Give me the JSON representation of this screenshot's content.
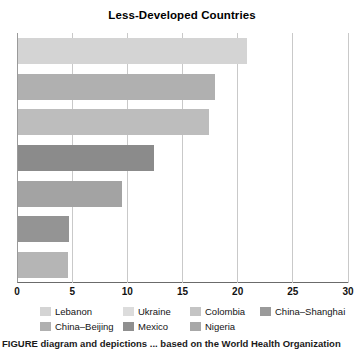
{
  "chart_data": {
    "type": "bar",
    "orientation": "horizontal",
    "title": "Less-Developed Countries",
    "xlabel": "",
    "ylabel": "",
    "xlim": [
      0,
      30
    ],
    "xticks": [
      0,
      5,
      10,
      15,
      20,
      25,
      30
    ],
    "xtick_labels": [
      "0",
      "5",
      "10",
      "15",
      "20",
      "25",
      "30"
    ],
    "grid": true,
    "grid_axis": "x",
    "legend_position": "bottom",
    "categories": [
      "Lebanon",
      "Ukraine",
      "Colombia",
      "China–Shanghai",
      "China–Beijing",
      "Mexico",
      "Nigeria"
    ],
    "values": [
      20.8,
      17.9,
      17.3,
      12.3,
      9.4,
      4.6,
      4.5
    ],
    "colors": [
      "#d4d4d4",
      "#b0b0b0",
      "#bdbdbd",
      "#8b8b8b",
      "#a3a3a3",
      "#949494",
      "#b5b5b5"
    ]
  },
  "legend": {
    "rows": [
      [
        {
          "label": "Lebanon",
          "color": "#d4d4d4"
        },
        {
          "label": "Ukraine",
          "color": "#dcdcdc"
        },
        {
          "label": "Colombia",
          "color": "#c4c4c4"
        },
        {
          "label": "China–Shanghai",
          "color": "#9a9a9a"
        }
      ],
      [
        {
          "label": "China–Beijing",
          "color": "#b0b0b0"
        },
        {
          "label": "Mexico",
          "color": "#8f8f8f"
        },
        {
          "label": "Nigeria",
          "color": "#a8a8a8"
        }
      ]
    ]
  },
  "caption": {
    "text": "FIGURE       diagram and depictions ... based on the World Health Organization"
  }
}
